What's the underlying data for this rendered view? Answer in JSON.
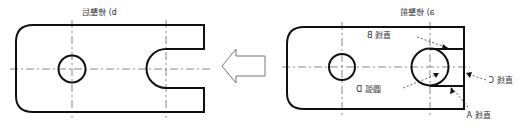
{
  "figure": {
    "mirrored": true,
    "panel_a": {
      "caption": "a) 修整前"
    },
    "panel_b": {
      "caption": "b) 修整后"
    },
    "labels": {
      "line_a": "直线 A",
      "line_b": "直线 B",
      "line_c": "直线 C",
      "arc_d": "圆弧 D"
    },
    "arrow": {
      "direction": "left",
      "meaning": "transformation a → b"
    },
    "colors": {
      "outline": "#111111",
      "centerline": "#555555",
      "arrow": "#777777",
      "text": "#333333"
    }
  }
}
